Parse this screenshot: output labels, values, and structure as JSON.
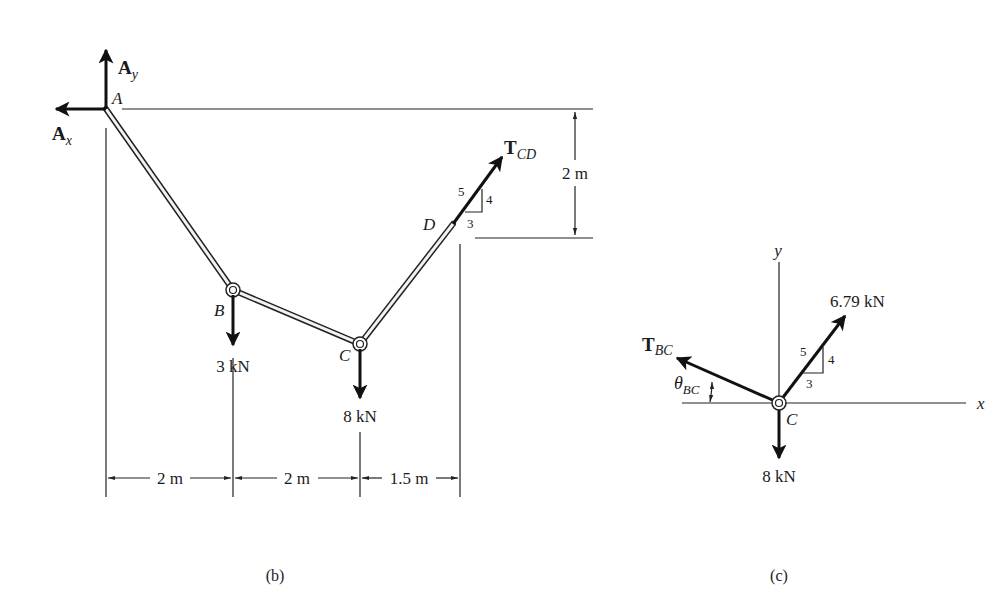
{
  "figure_b": {
    "caption": "(b)",
    "points": {
      "A": "A",
      "B": "B",
      "C": "C",
      "D": "D"
    },
    "reactions": {
      "Ay": {
        "symbol": "A",
        "subscript": "y"
      },
      "Ax": {
        "symbol": "A",
        "subscript": "x"
      }
    },
    "tension_CD": {
      "symbol": "T",
      "subscript": "CD"
    },
    "slope_triangle": {
      "hyp": "5",
      "rise": "4",
      "run": "3"
    },
    "loads": {
      "B": "3 kN",
      "C": "8 kN"
    },
    "dimensions": {
      "vertical": "2 m",
      "horizontal": [
        "2 m",
        "2 m",
        "1.5 m"
      ]
    }
  },
  "figure_c": {
    "caption": "(c)",
    "axes": {
      "x": "x",
      "y": "y"
    },
    "point": "C",
    "tension_BC": {
      "symbol": "T",
      "subscript": "BC"
    },
    "angle": {
      "symbol": "θ",
      "subscript": "BC"
    },
    "force_CD": "6.79 kN",
    "slope_triangle": {
      "hyp": "5",
      "rise": "4",
      "run": "3"
    },
    "load": "8 kN"
  }
}
